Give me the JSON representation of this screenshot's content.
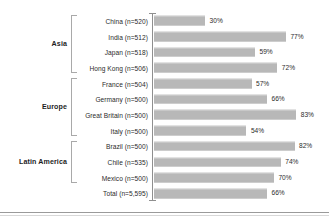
{
  "chart_data": {
    "type": "bar",
    "orientation": "horizontal",
    "title": "",
    "subtitle": "",
    "xlabel": "",
    "ylabel": "",
    "xlim": [
      0,
      100
    ],
    "grid": false,
    "legend": null,
    "value_suffix": "%",
    "bar_color": "#b8b8b8",
    "axis_color": "#8f8f8f",
    "text_color": "#2b2b2b",
    "categories": [
      "China (n=520)",
      "India (n=512)",
      "Japan (n=518)",
      "Hong Kong (n=506)",
      "France (n=504)",
      "Germany (n=500)",
      "Great Britain (n=500)",
      "Italy (n=500)",
      "Brazil (n=500)",
      "Chile (n=535)",
      "Mexico (n=500)",
      "Total (n=5,595)"
    ],
    "values": [
      30,
      77,
      59,
      72,
      57,
      66,
      83,
      54,
      82,
      74,
      70,
      66
    ],
    "value_labels": [
      "30%",
      "77%",
      "59%",
      "72%",
      "57%",
      "66%",
      "83%",
      "54%",
      "82%",
      "74%",
      "70%",
      "66%"
    ],
    "groups": [
      {
        "label": "Asia",
        "start": 0,
        "end": 3
      },
      {
        "label": "Europe",
        "start": 4,
        "end": 7
      },
      {
        "label": "Latin America",
        "start": 8,
        "end": 10
      }
    ]
  }
}
